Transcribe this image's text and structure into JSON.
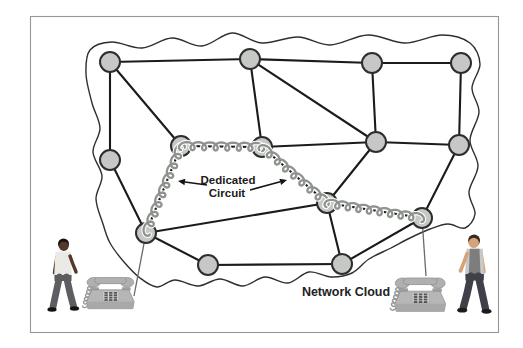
{
  "diagram": {
    "labels": {
      "dedicated_line1": "Dedicated",
      "dedicated_line2": "Circuit",
      "network_cloud": "Network Cloud"
    },
    "colors": {
      "background": "#ffffff",
      "frame_border": "#979797",
      "cloud_stroke": "#2f2f2f",
      "edge": "#1b1b1b",
      "node_fill": "#c6c8c6",
      "node_stroke": "#2d2d2d",
      "coil": "#8e938e",
      "coil_casing": "#ffffff",
      "phone_body": "#b6b6b6",
      "phone_line": "#6a6a6a",
      "label_color": "#1a1a1a"
    },
    "node_radius": 10,
    "nodes": [
      {
        "id": "n1",
        "x": 110,
        "y": 62
      },
      {
        "id": "n2",
        "x": 250,
        "y": 59
      },
      {
        "id": "n3",
        "x": 372,
        "y": 63
      },
      {
        "id": "n4",
        "x": 461,
        "y": 63
      },
      {
        "id": "n5",
        "x": 110,
        "y": 160
      },
      {
        "id": "n6",
        "x": 181,
        "y": 146
      },
      {
        "id": "n7",
        "x": 262,
        "y": 147
      },
      {
        "id": "n8",
        "x": 376,
        "y": 142
      },
      {
        "id": "n9",
        "x": 459,
        "y": 145
      },
      {
        "id": "n10",
        "x": 327,
        "y": 203
      },
      {
        "id": "n11",
        "x": 422,
        "y": 218
      },
      {
        "id": "n12",
        "x": 146,
        "y": 233
      },
      {
        "id": "n13",
        "x": 208,
        "y": 265
      },
      {
        "id": "n14",
        "x": 342,
        "y": 264
      }
    ],
    "edges": [
      [
        "n1",
        "n2"
      ],
      [
        "n2",
        "n3"
      ],
      [
        "n3",
        "n4"
      ],
      [
        "n1",
        "n5"
      ],
      [
        "n1",
        "n6"
      ],
      [
        "n2",
        "n7"
      ],
      [
        "n2",
        "n8"
      ],
      [
        "n3",
        "n8"
      ],
      [
        "n4",
        "n9"
      ],
      [
        "n8",
        "n9"
      ],
      [
        "n7",
        "n8"
      ],
      [
        "n6",
        "n7"
      ],
      [
        "n6",
        "n12"
      ],
      [
        "n7",
        "n10"
      ],
      [
        "n10",
        "n11"
      ],
      [
        "n8",
        "n10"
      ],
      [
        "n10",
        "n12"
      ],
      [
        "n10",
        "n14"
      ],
      [
        "n9",
        "n11"
      ],
      [
        "n11",
        "n14"
      ],
      [
        "n12",
        "n13"
      ],
      [
        "n13",
        "n14"
      ],
      [
        "n5",
        "n12"
      ]
    ],
    "dedicated_circuit_path": [
      "n12",
      "n6",
      "n7",
      "n10",
      "n11"
    ],
    "cloud_points": [
      [
        86,
        74
      ],
      [
        90,
        50
      ],
      [
        112,
        42
      ],
      [
        142,
        48
      ],
      [
        172,
        38
      ],
      [
        202,
        46
      ],
      [
        232,
        33
      ],
      [
        262,
        43
      ],
      [
        298,
        37
      ],
      [
        330,
        45
      ],
      [
        368,
        35
      ],
      [
        405,
        43
      ],
      [
        442,
        35
      ],
      [
        470,
        43
      ],
      [
        480,
        64
      ],
      [
        472,
        88
      ],
      [
        479,
        112
      ],
      [
        470,
        140
      ],
      [
        478,
        166
      ],
      [
        469,
        192
      ],
      [
        475,
        214
      ],
      [
        465,
        228
      ],
      [
        448,
        224
      ],
      [
        430,
        229
      ],
      [
        410,
        238
      ],
      [
        391,
        248
      ],
      [
        369,
        259
      ],
      [
        352,
        273
      ],
      [
        331,
        277
      ],
      [
        309,
        272
      ],
      [
        288,
        283
      ],
      [
        265,
        277
      ],
      [
        243,
        286
      ],
      [
        220,
        279
      ],
      [
        198,
        286
      ],
      [
        175,
        280
      ],
      [
        157,
        287
      ],
      [
        140,
        278
      ],
      [
        124,
        262
      ],
      [
        110,
        243
      ],
      [
        103,
        224
      ],
      [
        96,
        199
      ],
      [
        102,
        176
      ],
      [
        93,
        152
      ],
      [
        100,
        128
      ],
      [
        92,
        103
      ]
    ],
    "arrows": [
      {
        "from": [
          207,
          185
        ],
        "to": [
          178,
          181
        ]
      },
      {
        "from": [
          250,
          190
        ],
        "to": [
          287,
          180
        ]
      }
    ],
    "phone_lines": [
      {
        "x1": 146,
        "y1": 233,
        "x2": 134,
        "y2": 296
      },
      {
        "x1": 422,
        "y1": 218,
        "x2": 426,
        "y2": 276
      }
    ],
    "phones": [
      {
        "x": 84,
        "y": 270,
        "scale": 0.88
      },
      {
        "x": 392,
        "y": 270,
        "scale": 0.94
      }
    ],
    "people": [
      {
        "x": 46,
        "y": 237,
        "scale": 1.0,
        "flip": false,
        "colors": {
          "skin": "#54382a",
          "hair": "#17100c",
          "shirt": "#eceae6",
          "pants": "#5d5d62",
          "shoes": "#141414",
          "vest": null
        }
      },
      {
        "x": 493,
        "y": 233,
        "scale": 1.08,
        "flip": true,
        "colors": {
          "skin": "#d7a376",
          "hair": "#332a22",
          "shirt": "#c8c8c8",
          "pants": "#3f404a",
          "shoes": "#1c1c1c",
          "vest": "#7d7d7d"
        }
      }
    ]
  }
}
